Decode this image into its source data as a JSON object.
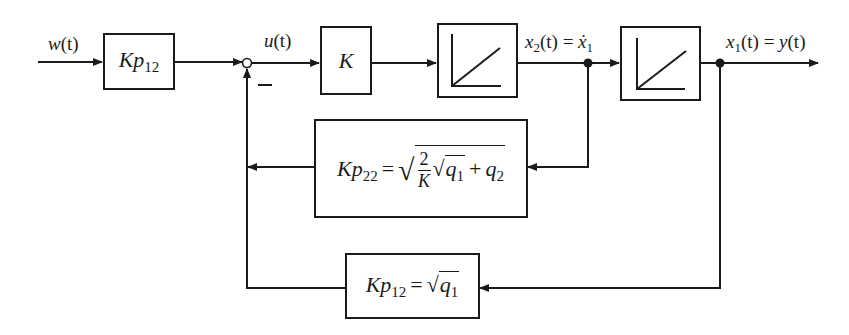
{
  "diagram": {
    "type": "control block diagram",
    "signals": {
      "input": {
        "name": "w",
        "arg": "(t)"
      },
      "control": {
        "name": "u",
        "arg": "(t)"
      },
      "state2": {
        "name": "x",
        "sub": "2",
        "arg": "(t)",
        "eq": "=",
        "rhs_name": "ẋ",
        "rhs_sub": "1"
      },
      "state1": {
        "name": "x",
        "sub": "1",
        "arg": "(t)",
        "eq": "=",
        "rhs_name": "y",
        "rhs_arg": "(t)"
      }
    },
    "blocks": {
      "prefilter": {
        "name": "Kp",
        "sub": "12"
      },
      "gain": {
        "name": "K"
      },
      "integrator1": {
        "symbol": "ramp"
      },
      "integrator2": {
        "symbol": "ramp"
      },
      "feedback_inner": {
        "name": "Kp",
        "sub": "22",
        "eq": "=",
        "frac_num": "2",
        "frac_den": "K",
        "q1": "q",
        "q1_sub": "1",
        "plus": "+",
        "q2": "q",
        "q2_sub": "2"
      },
      "feedback_outer": {
        "name": "Kp",
        "sub": "12",
        "eq": "=",
        "q1": "q",
        "q1_sub": "1"
      }
    },
    "summing_junction": {
      "sign": "−"
    },
    "colors": {
      "line": "#1a1a1a",
      "background": "#ffffff"
    }
  }
}
